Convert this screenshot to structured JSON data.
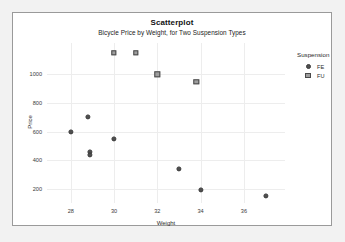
{
  "chart_data": {
    "type": "scatter",
    "title": "Scatterplot",
    "subtitle": "Bicycle Price by Weight, for Two Suspension Types",
    "xlabel": "Weight",
    "ylabel": "Price",
    "xlim": [
      26.9,
      37.9
    ],
    "ylim": [
      100,
      1220
    ],
    "xticks": [
      28,
      30,
      32,
      34,
      36
    ],
    "yticks": [
      200,
      400,
      600,
      800,
      1000
    ],
    "grid": true,
    "legend": {
      "title": "Suspension",
      "position": "right",
      "entries": [
        {
          "label": "FE",
          "marker": "circle",
          "color": "#4f4f4f"
        },
        {
          "label": "FU",
          "marker": "square",
          "color": "#9e9e9e"
        }
      ]
    },
    "series": [
      {
        "name": "FE",
        "marker": "circle",
        "color": "#4f4f4f",
        "points": [
          {
            "x": 28.0,
            "y": 600
          },
          {
            "x": 28.8,
            "y": 700
          },
          {
            "x": 28.9,
            "y": 460
          },
          {
            "x": 28.9,
            "y": 435
          },
          {
            "x": 30.0,
            "y": 550
          },
          {
            "x": 33.0,
            "y": 340
          },
          {
            "x": 34.0,
            "y": 190
          },
          {
            "x": 37.0,
            "y": 150
          }
        ]
      },
      {
        "name": "FU",
        "marker": "square",
        "color": "#9e9e9e",
        "points": [
          {
            "x": 30.0,
            "y": 1150
          },
          {
            "x": 31.0,
            "y": 1150
          },
          {
            "x": 32.0,
            "y": 1000
          },
          {
            "x": 33.8,
            "y": 950
          }
        ]
      }
    ]
  }
}
